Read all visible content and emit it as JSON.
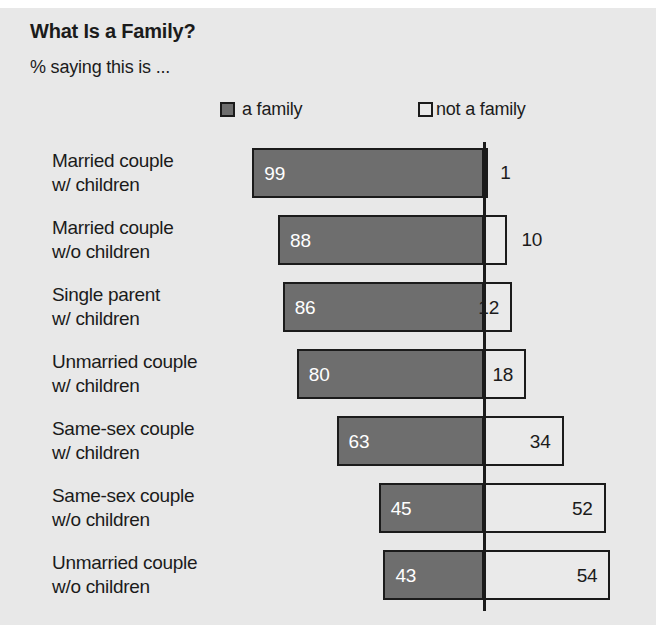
{
  "title": "What Is a Family?",
  "subtitle": "% saying this is ...",
  "legend": {
    "family": {
      "label": "a family",
      "swatch": "filled-square-icon",
      "color": "#6e6e6e"
    },
    "not_family": {
      "label": "not a family",
      "swatch": "hollow-square-icon",
      "color": "#eaeaea"
    }
  },
  "colors": {
    "background": "#e8e8e8",
    "bar_family": "#6e6e6e",
    "bar_not_family": "#eaeaea",
    "outline": "#1b1b1b",
    "text": "#1b1b1b",
    "value_on_dark": "#ffffff"
  },
  "rows": [
    {
      "line1": "Married couple",
      "line2": "w/ children",
      "family": 99,
      "not_family": 1
    },
    {
      "line1": "Married couple",
      "line2": "w/o children",
      "family": 88,
      "not_family": 10
    },
    {
      "line1": "Single parent",
      "line2": "w/ children",
      "family": 86,
      "not_family": 12
    },
    {
      "line1": "Unmarried couple",
      "line2": "w/ children",
      "family": 80,
      "not_family": 18
    },
    {
      "line1": "Same-sex couple",
      "line2": "w/ children",
      "family": 63,
      "not_family": 34
    },
    {
      "line1": "Same-sex couple",
      "line2": "w/o children",
      "family": 45,
      "not_family": 52
    },
    {
      "line1": "Unmarried couple",
      "line2": "w/o children",
      "family": 43,
      "not_family": 54
    }
  ],
  "chart_data": {
    "type": "bar",
    "title": "What Is a Family?",
    "subtitle": "% saying this is ...",
    "orientation": "horizontal",
    "layout": "diverging-from-center-axis",
    "categories": [
      "Married couple w/ children",
      "Married couple w/o children",
      "Single parent w/ children",
      "Unmarried couple w/ children",
      "Same-sex couple w/ children",
      "Same-sex couple w/o children",
      "Unmarried couple w/o children"
    ],
    "series": [
      {
        "name": "a family",
        "values": [
          99,
          88,
          86,
          80,
          63,
          45,
          43
        ],
        "direction": "left",
        "color": "#6e6e6e"
      },
      {
        "name": "not a family",
        "values": [
          1,
          10,
          12,
          18,
          34,
          52,
          54
        ],
        "direction": "right",
        "color": "#eaeaea"
      }
    ],
    "xlabel": "",
    "ylabel": "",
    "unit": "percent",
    "xlim": [
      0,
      100
    ],
    "grid": false,
    "legend_position": "top",
    "data_labels": true
  }
}
